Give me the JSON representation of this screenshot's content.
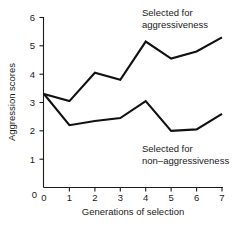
{
  "chart_data": {
    "type": "line",
    "title": "",
    "xlabel": "Generations of selection",
    "ylabel": "Aggression scores",
    "x": [
      0,
      1,
      2,
      3,
      4,
      5,
      6,
      7
    ],
    "xtick_labels": [
      "0",
      "1",
      "2",
      "3",
      "4",
      "5",
      "6",
      "7"
    ],
    "ytick_labels": [
      "0",
      "1",
      "2",
      "3",
      "4",
      "5",
      "6"
    ],
    "yticks": [
      0,
      1,
      2,
      3,
      4,
      5,
      6
    ],
    "xlim": [
      0,
      7
    ],
    "ylim": [
      0,
      6
    ],
    "grid": false,
    "legend_position": "inline-annotation",
    "series": [
      {
        "name": "Selected for aggressiveness",
        "values": [
          3.3,
          3.05,
          4.05,
          3.8,
          5.15,
          4.55,
          4.8,
          5.3
        ],
        "color": "#111111"
      },
      {
        "name": "Selected for non-aggressiveness",
        "values": [
          3.3,
          2.2,
          2.35,
          2.45,
          3.05,
          2.0,
          2.05,
          2.6
        ],
        "color": "#111111"
      }
    ],
    "annotations": [
      {
        "id": "upper",
        "line1": "Selected for",
        "line2": "aggressiveness"
      },
      {
        "id": "lower",
        "line1": "Selected for",
        "line2": "non–aggressiveness"
      }
    ]
  }
}
